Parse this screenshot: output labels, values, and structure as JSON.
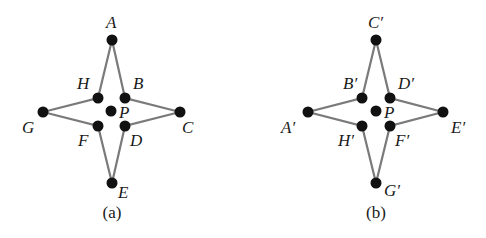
{
  "figures": [
    {
      "caption": "(a)",
      "center_label": "P",
      "points": [
        {
          "id": "A",
          "label": "A",
          "x": 112,
          "y": 40,
          "lx": 106,
          "ly": 28
        },
        {
          "id": "B",
          "label": "B",
          "x": 125,
          "y": 98,
          "lx": 133,
          "ly": 89
        },
        {
          "id": "C",
          "label": "C",
          "x": 180,
          "y": 112,
          "lx": 182,
          "ly": 133
        },
        {
          "id": "D",
          "label": "D",
          "x": 125,
          "y": 126,
          "lx": 130,
          "ly": 146
        },
        {
          "id": "E",
          "label": "E",
          "x": 112,
          "y": 183,
          "lx": 118,
          "ly": 198
        },
        {
          "id": "F",
          "label": "F",
          "x": 98,
          "y": 126,
          "lx": 78,
          "ly": 146
        },
        {
          "id": "G",
          "label": "G",
          "x": 43,
          "y": 112,
          "lx": 22,
          "ly": 133
        },
        {
          "id": "H",
          "label": "H",
          "x": 98,
          "y": 98,
          "lx": 77,
          "ly": 89
        }
      ],
      "center": {
        "x": 111,
        "y": 111,
        "lx": 119,
        "ly": 118
      }
    },
    {
      "caption": "(b)",
      "center_label": "P",
      "points": [
        {
          "id": "A'",
          "label": "A′",
          "x": 308,
          "y": 112,
          "lx": 281,
          "ly": 133
        },
        {
          "id": "B'",
          "label": "B′",
          "x": 362,
          "y": 98,
          "lx": 343,
          "ly": 89
        },
        {
          "id": "C'",
          "label": "C′",
          "x": 376,
          "y": 40,
          "lx": 368,
          "ly": 28
        },
        {
          "id": "D'",
          "label": "D′",
          "x": 390,
          "y": 98,
          "lx": 398,
          "ly": 89
        },
        {
          "id": "E'",
          "label": "E′",
          "x": 443,
          "y": 112,
          "lx": 451,
          "ly": 133
        },
        {
          "id": "F'",
          "label": "F′",
          "x": 390,
          "y": 126,
          "lx": 395,
          "ly": 146
        },
        {
          "id": "G'",
          "label": "G′",
          "x": 376,
          "y": 183,
          "lx": 384,
          "ly": 196
        },
        {
          "id": "H'",
          "label": "H′",
          "x": 362,
          "y": 126,
          "lx": 338,
          "ly": 146
        }
      ],
      "center": {
        "x": 376,
        "y": 111,
        "lx": 384,
        "ly": 118
      }
    }
  ],
  "captions": {
    "a": "(a)",
    "b": "(b)"
  },
  "colors": {
    "edge": "#7a7a7a",
    "point": "#111111",
    "text": "#1a1a1a"
  }
}
